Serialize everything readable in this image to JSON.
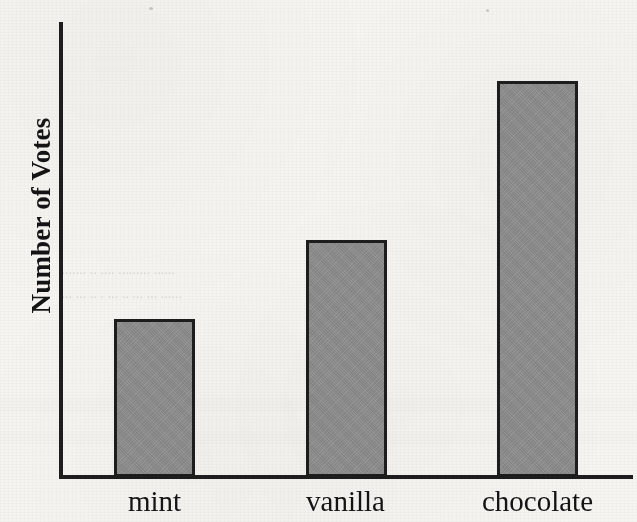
{
  "chart_data": {
    "type": "bar",
    "title": "",
    "subtitle": "",
    "xlabel": "",
    "ylabel": "Number of Votes",
    "categories": [
      "mint",
      "vanilla",
      "chocolate"
    ],
    "values": [
      4,
      6,
      10
    ],
    "ylim": [
      0,
      11.5
    ],
    "grid": false,
    "legend": null,
    "legend_position": "none",
    "axis_ticks": {
      "x": [
        "mint",
        "vanilla",
        "chocolate"
      ],
      "y": []
    },
    "annotations": [],
    "bar_fill_color": "#8c8c8c",
    "bar_border_color": "#1d1d1d",
    "axis_color": "#1d1d1d",
    "background_color": "#f6f5f2"
  },
  "axes": {
    "y_title": "Number of Votes"
  },
  "background_artifacts": {
    "ghost_line_1": "........ .. .... ......... ......",
    "ghost_line_2": ".... ... .. . ... .. ... ... ......",
    "ghost_line_3": ". .. .... ...."
  }
}
